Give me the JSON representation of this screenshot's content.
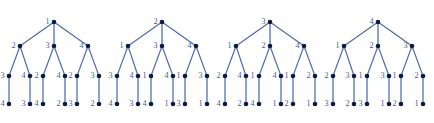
{
  "figure": {
    "name": "four-rooted-labelled-trees",
    "width": 434,
    "height": 123,
    "background": "#ffffff",
    "edge_color": "#4a6aa8",
    "vertical_edge_color": "#6a86bd",
    "node_color": "#0d1b3e",
    "label_color": "#3d5f9e",
    "node_radius": 2.3,
    "level_y": [
      22,
      46,
      76,
      104
    ],
    "tree_count": 4,
    "tree_origins": [
      0,
      108,
      216,
      324
    ],
    "tree_width": 108
  },
  "chart_data": {
    "type": "diagram",
    "title": "",
    "subtitle": "",
    "trees": [
      {
        "id": "tree-1",
        "root": {
          "label": "1",
          "x": 54,
          "y": 22
        },
        "level1": [
          {
            "label": "2",
            "x": 20,
            "y": 46
          },
          {
            "label": "3",
            "x": 54,
            "y": 46
          },
          {
            "label": "4",
            "x": 88,
            "y": 46
          }
        ],
        "level2": [
          {
            "label": "3",
            "x": 9,
            "y": 76,
            "parent": 0
          },
          {
            "label": "4",
            "x": 30,
            "y": 76,
            "parent": 0
          },
          {
            "label": "2",
            "x": 43,
            "y": 76,
            "parent": 1
          },
          {
            "label": "4",
            "x": 65,
            "y": 76,
            "parent": 1
          },
          {
            "label": "2",
            "x": 77,
            "y": 76,
            "parent": 2
          },
          {
            "label": "3",
            "x": 99,
            "y": 76,
            "parent": 2
          }
        ],
        "level3": [
          {
            "label": "4",
            "x": 9,
            "y": 104,
            "parent": 0
          },
          {
            "label": "3",
            "x": 30,
            "y": 104,
            "parent": 1
          },
          {
            "label": "4",
            "x": 43,
            "y": 104,
            "parent": 2
          },
          {
            "label": "2",
            "x": 65,
            "y": 104,
            "parent": 3
          },
          {
            "label": "3",
            "x": 77,
            "y": 104,
            "parent": 4
          },
          {
            "label": "2",
            "x": 99,
            "y": 104,
            "parent": 5
          }
        ]
      },
      {
        "id": "tree-2",
        "root": {
          "label": "2",
          "x": 162,
          "y": 22
        },
        "level1": [
          {
            "label": "1",
            "x": 128,
            "y": 46
          },
          {
            "label": "3",
            "x": 162,
            "y": 46
          },
          {
            "label": "4",
            "x": 196,
            "y": 46
          }
        ],
        "level2": [
          {
            "label": "3",
            "x": 117,
            "y": 76,
            "parent": 0
          },
          {
            "label": "4",
            "x": 138,
            "y": 76,
            "parent": 0
          },
          {
            "label": "1",
            "x": 151,
            "y": 76,
            "parent": 1
          },
          {
            "label": "4",
            "x": 173,
            "y": 76,
            "parent": 1
          },
          {
            "label": "1",
            "x": 185,
            "y": 76,
            "parent": 2
          },
          {
            "label": "3",
            "x": 207,
            "y": 76,
            "parent": 2
          }
        ],
        "level3": [
          {
            "label": "4",
            "x": 117,
            "y": 104,
            "parent": 0
          },
          {
            "label": "3",
            "x": 138,
            "y": 104,
            "parent": 1
          },
          {
            "label": "4",
            "x": 151,
            "y": 104,
            "parent": 2
          },
          {
            "label": "1",
            "x": 173,
            "y": 104,
            "parent": 3
          },
          {
            "label": "3",
            "x": 185,
            "y": 104,
            "parent": 4
          },
          {
            "label": "1",
            "x": 207,
            "y": 104,
            "parent": 5
          }
        ]
      },
      {
        "id": "tree-3",
        "root": {
          "label": "3",
          "x": 270,
          "y": 22
        },
        "level1": [
          {
            "label": "1",
            "x": 236,
            "y": 46
          },
          {
            "label": "2",
            "x": 270,
            "y": 46
          },
          {
            "label": "4",
            "x": 304,
            "y": 46
          }
        ],
        "level2": [
          {
            "label": "2",
            "x": 225,
            "y": 76,
            "parent": 0
          },
          {
            "label": "4",
            "x": 246,
            "y": 76,
            "parent": 0
          },
          {
            "label": "1",
            "x": 259,
            "y": 76,
            "parent": 1
          },
          {
            "label": "4",
            "x": 281,
            "y": 76,
            "parent": 1
          },
          {
            "label": "1",
            "x": 293,
            "y": 76,
            "parent": 2
          },
          {
            "label": "2",
            "x": 315,
            "y": 76,
            "parent": 2
          }
        ],
        "level3": [
          {
            "label": "4",
            "x": 225,
            "y": 104,
            "parent": 0
          },
          {
            "label": "2",
            "x": 246,
            "y": 104,
            "parent": 1
          },
          {
            "label": "4",
            "x": 259,
            "y": 104,
            "parent": 2
          },
          {
            "label": "1",
            "x": 281,
            "y": 104,
            "parent": 3
          },
          {
            "label": "2",
            "x": 293,
            "y": 104,
            "parent": 4
          },
          {
            "label": "1",
            "x": 315,
            "y": 104,
            "parent": 5
          }
        ]
      },
      {
        "id": "tree-4",
        "root": {
          "label": "4",
          "x": 378,
          "y": 22
        },
        "level1": [
          {
            "label": "1",
            "x": 344,
            "y": 46
          },
          {
            "label": "2",
            "x": 378,
            "y": 46
          },
          {
            "label": "3",
            "x": 412,
            "y": 46
          }
        ],
        "level2": [
          {
            "label": "2",
            "x": 333,
            "y": 76,
            "parent": 0
          },
          {
            "label": "3",
            "x": 354,
            "y": 76,
            "parent": 0
          },
          {
            "label": "1",
            "x": 367,
            "y": 76,
            "parent": 1
          },
          {
            "label": "3",
            "x": 389,
            "y": 76,
            "parent": 1
          },
          {
            "label": "1",
            "x": 401,
            "y": 76,
            "parent": 2
          },
          {
            "label": "2",
            "x": 423,
            "y": 76,
            "parent": 2
          }
        ],
        "level3": [
          {
            "label": "3",
            "x": 333,
            "y": 104,
            "parent": 0
          },
          {
            "label": "2",
            "x": 354,
            "y": 104,
            "parent": 1
          },
          {
            "label": "3",
            "x": 367,
            "y": 104,
            "parent": 2
          },
          {
            "label": "1",
            "x": 389,
            "y": 104,
            "parent": 3
          },
          {
            "label": "2",
            "x": 401,
            "y": 104,
            "parent": 4
          },
          {
            "label": "1",
            "x": 423,
            "y": 104,
            "parent": 5
          }
        ]
      }
    ]
  }
}
